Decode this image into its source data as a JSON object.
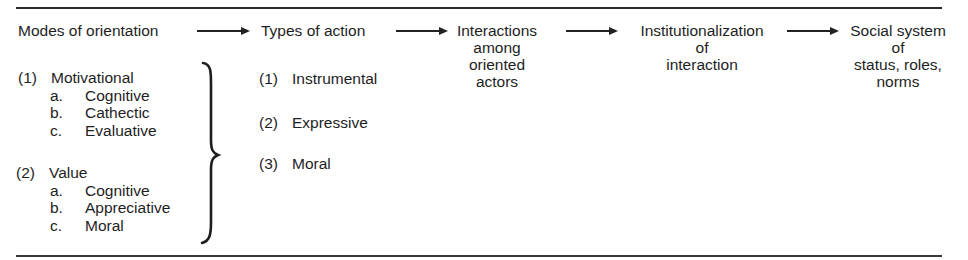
{
  "diagram": {
    "stages": [
      {
        "id": "modes",
        "lines": [
          "Modes of orientation"
        ]
      },
      {
        "id": "types",
        "lines": [
          "Types of action"
        ]
      },
      {
        "id": "interactions",
        "lines": [
          "Interactions",
          "among",
          "oriented",
          "actors"
        ]
      },
      {
        "id": "institutionalization",
        "lines": [
          "Institutionalization",
          "of",
          "interaction"
        ]
      },
      {
        "id": "social_system",
        "lines": [
          "Social system",
          "of",
          "status, roles,",
          "norms"
        ]
      }
    ],
    "arrows": [
      {
        "from": "modes",
        "to": "types"
      },
      {
        "from": "types",
        "to": "interactions"
      },
      {
        "from": "interactions",
        "to": "institutionalization"
      },
      {
        "from": "institutionalization",
        "to": "social_system"
      }
    ],
    "modes_list": [
      {
        "num": "(1)",
        "label": "Motivational",
        "subs": [
          {
            "letter": "a.",
            "label": "Cognitive"
          },
          {
            "letter": "b.",
            "label": "Cathectic"
          },
          {
            "letter": "c.",
            "label": "Evaluative"
          }
        ]
      },
      {
        "num": "(2)",
        "label": "Value",
        "subs": [
          {
            "letter": "a.",
            "label": "Cognitive"
          },
          {
            "letter": "b.",
            "label": "Appreciative"
          },
          {
            "letter": "c.",
            "label": "Moral"
          }
        ]
      }
    ],
    "types_list": [
      {
        "num": "(1)",
        "label": "Instrumental"
      },
      {
        "num": "(2)",
        "label": "Expressive"
      },
      {
        "num": "(3)",
        "label": "Moral"
      }
    ],
    "colors": {
      "ink": "#1e1e1e",
      "background": "#ffffff"
    }
  }
}
